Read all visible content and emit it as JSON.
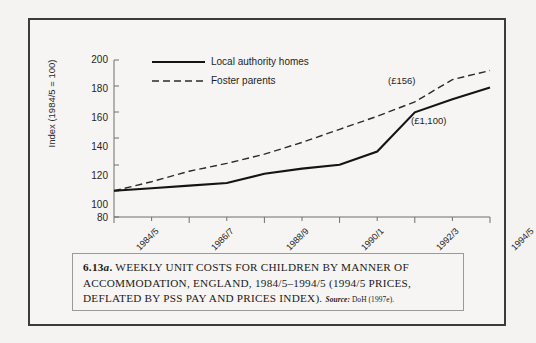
{
  "figure": {
    "caption_number": "6.13a.",
    "caption_body": "WEEKLY UNIT COSTS FOR CHILDREN BY MANNER OF ACCOMMODATION, ENGLAND, 1984/5–1994/5 (1994/5 PRICES, DEFLATED BY PSS PAY AND PRICES INDEX).",
    "source_label": "Source:",
    "source_value": "DoH (1997e)."
  },
  "chart_data": {
    "type": "line",
    "title": "",
    "xlabel": "",
    "ylabel": "Index (1984/5 = 100)",
    "ylim": [
      80,
      200
    ],
    "yticks": [
      80,
      100,
      120,
      140,
      160,
      180,
      200
    ],
    "x": [
      "1984/5",
      "1985/6",
      "1986/7",
      "1987/8",
      "1988/9",
      "1989/90",
      "1990/1",
      "1991/2",
      "1992/3",
      "1993/4",
      "1994/5"
    ],
    "xtick_labels": [
      "1984/5",
      "1986/7",
      "1988/9",
      "1990/1",
      "1992/3",
      "1994/5"
    ],
    "xtick_label_indices": [
      0,
      2,
      4,
      6,
      8,
      10
    ],
    "grid": false,
    "legend_position": "top-left",
    "series": [
      {
        "name": "Local authority homes",
        "style": "solid",
        "color": "#1a1a1a",
        "values": [
          100,
          102,
          104,
          106,
          113,
          117,
          120,
          130,
          160,
          170,
          179
        ],
        "end_annotation": "(£1,100)"
      },
      {
        "name": "Foster parents",
        "style": "dashed",
        "color": "#2a2a2a",
        "values": [
          100,
          107,
          115,
          121,
          128,
          137,
          147,
          157,
          168,
          185,
          192
        ],
        "end_annotation": "(£156)"
      }
    ],
    "annotations": [
      {
        "text": "(£156)",
        "series": "Foster parents"
      },
      {
        "text": "(£1,100)",
        "series": "Local authority homes"
      }
    ]
  }
}
